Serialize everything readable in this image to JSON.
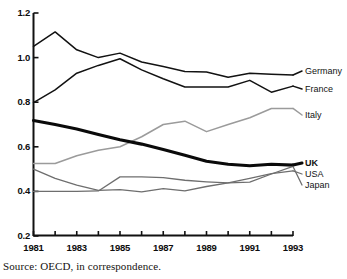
{
  "source_note": "Source: OECD, in correspondence.",
  "axes": {
    "y_ticks": [
      "1.2",
      "1.0",
      "0.8",
      "0.6",
      "0.4",
      "0.2"
    ],
    "x_ticks": [
      "1981",
      "1983",
      "1985",
      "1987",
      "1989",
      "1991",
      "1993"
    ]
  },
  "legend": {
    "germany": "Germany",
    "france": "France",
    "italy": "Italy",
    "uk": "UK",
    "usa": "USA",
    "japan": "Japan"
  },
  "chart_data": {
    "type": "line",
    "title": "",
    "subtitle": "",
    "xlabel": "",
    "ylabel": "",
    "xlim": [
      1981,
      1993
    ],
    "ylim": [
      0.2,
      1.2
    ],
    "grid": false,
    "legend_position": "right-inline",
    "x": [
      1981,
      1982,
      1983,
      1984,
      1985,
      1986,
      1987,
      1988,
      1989,
      1990,
      1991,
      1992,
      1993
    ],
    "y_tick_values": [
      1.2,
      1.0,
      0.8,
      0.6,
      0.4,
      0.2
    ],
    "x_tick_values": [
      1981,
      1983,
      1985,
      1987,
      1989,
      1991,
      1993
    ],
    "x_minor_ticks": [
      1981,
      1982,
      1983,
      1984,
      1985,
      1986,
      1987,
      1988,
      1989,
      1990,
      1991,
      1992,
      1993
    ],
    "series": [
      {
        "name": "Germany",
        "color": "#121212",
        "width": 1.5,
        "values": [
          1.05,
          1.115,
          1.035,
          1.0,
          1.02,
          0.98,
          0.96,
          0.938,
          0.935,
          0.912,
          0.93,
          0.925,
          0.922
        ]
      },
      {
        "name": "France",
        "color": "#121212",
        "width": 1.5,
        "values": [
          0.798,
          0.855,
          0.93,
          0.965,
          0.995,
          0.945,
          0.905,
          0.868,
          0.868,
          0.868,
          0.898,
          0.845,
          0.872
        ]
      },
      {
        "name": "Italy",
        "color": "#9b9b9b",
        "width": 1.5,
        "values": [
          0.525,
          0.525,
          0.56,
          0.585,
          0.6,
          0.645,
          0.7,
          0.715,
          0.668,
          0.7,
          0.73,
          0.772,
          0.772
        ]
      },
      {
        "name": "UK",
        "color": "#0a0a0a",
        "width": 3.1,
        "values": [
          0.718,
          0.7,
          0.68,
          0.655,
          0.632,
          0.612,
          0.588,
          0.562,
          0.535,
          0.522,
          0.515,
          0.522,
          0.518
        ]
      },
      {
        "name": "USA",
        "color": "#6e6e6e",
        "width": 1.3,
        "values": [
          0.5,
          0.458,
          0.428,
          0.405,
          0.408,
          0.398,
          0.412,
          0.402,
          0.422,
          0.438,
          0.458,
          0.48,
          0.492
        ]
      },
      {
        "name": "Japan",
        "color": "#6e6e6e",
        "width": 1.3,
        "values": [
          0.4,
          0.4,
          0.4,
          0.402,
          0.465,
          0.465,
          0.462,
          0.45,
          0.443,
          0.438,
          0.442,
          0.478,
          0.512
        ]
      }
    ]
  }
}
